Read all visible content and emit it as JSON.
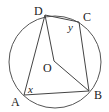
{
  "diagram": {
    "circle": {
      "cx": 55,
      "cy": 62,
      "r": 46,
      "color": "#555555"
    },
    "points": {
      "A": {
        "x": 24,
        "y": 95,
        "label": "A",
        "lx": 11,
        "ly": 106
      },
      "B": {
        "x": 89,
        "y": 91,
        "label": "B",
        "lx": 94,
        "ly": 99
      },
      "C": {
        "x": 79,
        "y": 22,
        "label": "C",
        "lx": 83,
        "ly": 21
      },
      "D": {
        "x": 45,
        "y": 15,
        "label": "D",
        "lx": 34,
        "ly": 15
      },
      "O": {
        "x": 54,
        "y": 61,
        "label": "O",
        "lx": 43,
        "ly": 72
      }
    },
    "angles": {
      "x": {
        "label": "x",
        "lx": 28,
        "ly": 93
      },
      "y": {
        "label": "y",
        "lx": 68,
        "ly": 31
      }
    },
    "segments": [
      "AB",
      "BC",
      "CD",
      "DA",
      "DO",
      "OB"
    ]
  }
}
